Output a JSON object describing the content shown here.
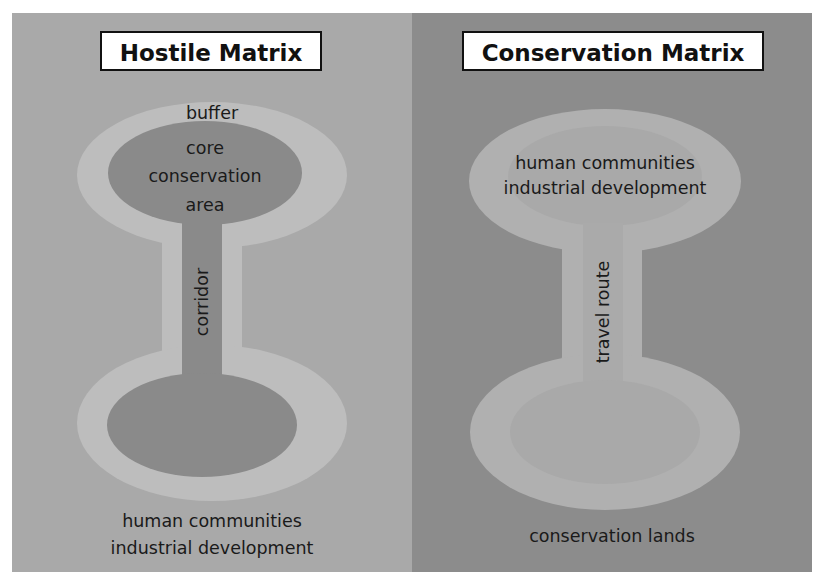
{
  "left_panel": {
    "title": "Hostile Matrix",
    "labels": {
      "buffer": "buffer",
      "core_line1": "core",
      "core_line2": "conservation",
      "core_line3": "area",
      "corridor": "corridor",
      "matrix_line1": "human communities",
      "matrix_line2": "industrial development"
    },
    "colors": {
      "background": "#a9a9a9",
      "buffer": "#bdbdbd",
      "core": "#8a8a8a"
    }
  },
  "right_panel": {
    "title": "Conservation Matrix",
    "labels": {
      "top_line1": "human communities",
      "top_line2": "industrial development",
      "route": "travel route",
      "matrix": "conservation lands"
    },
    "colors": {
      "background": "#8c8c8c",
      "outer": "#b0b0b0",
      "inner": "#a9a9a9"
    }
  }
}
